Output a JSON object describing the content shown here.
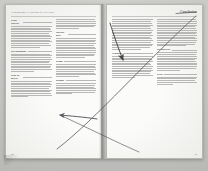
{
  "document": {
    "kind": "scanned-book-spread",
    "media": "photograph of an open book, two facing pages",
    "background_color": "#c9c9c7",
    "paper_color": "#fbfbf9",
    "ink_color": "#3a3a3a"
  },
  "left_page": {
    "running_head": "Terminologie et notions de référence",
    "folio": "84",
    "columns": [
      {
        "name": "left-column",
        "entries": [
          {
            "head": "Point central.",
            "body_lines": 14
          },
          {
            "head": "Rayonnement.",
            "body_lines": 12
          },
          {
            "head": "Plan de masse.",
            "body_lines": 11
          }
        ]
      },
      {
        "name": "right-column",
        "entries": [
          {
            "head": "",
            "body_lines": 6
          },
          {
            "head": "Surface utile.",
            "body_lines": 13
          },
          {
            "head": "Trame.",
            "body_lines": 10
          },
          {
            "head": "Module.",
            "body_lines": 9
          }
        ]
      }
    ]
  },
  "right_page": {
    "running_head": "Conclusion",
    "folio": "85",
    "columns": [
      {
        "name": "left-column",
        "entries": [
          {
            "head": "",
            "body_lines": 18
          },
          {
            "head": "Synthèse.",
            "body_lines": 14
          }
        ]
      },
      {
        "name": "right-column",
        "entries": [
          {
            "head": "",
            "body_lines": 16
          },
          {
            "head": "Perspectives.",
            "body_lines": 12
          },
          {
            "head": "Notes.",
            "body_lines": 6
          }
        ]
      }
    ]
  },
  "annotations": {
    "ink_color": "#4a4a52",
    "items": [
      {
        "name": "long-diagonal-arrow",
        "type": "arrow",
        "description": "long hand-drawn diagonal stroke rising from lower-left of the left page to the upper-right corner of the right page",
        "from": [
          58,
          148
        ],
        "to": [
          196,
          16
        ],
        "arrowhead": "none"
      },
      {
        "name": "down-left-arrow",
        "type": "arrow",
        "description": "short arrow from upper-left of the right page pointing down and to the left, with a filled arrowhead",
        "from": [
          111,
          24
        ],
        "to": [
          124,
          62
        ],
        "arrowhead": "filled"
      },
      {
        "name": "lower-diagonal-stroke",
        "type": "line",
        "description": "diagonal stroke descending from the mid right page toward the lower right, crossing the first diagonal",
        "from": [
          62,
          116
        ],
        "to": [
          140,
          152
        ],
        "arrowhead": "none"
      },
      {
        "name": "left-pointing-arrow",
        "type": "arrow",
        "description": "arrow on the left page pointing left at mid height",
        "from": [
          96,
          118
        ],
        "to": [
          58,
          115
        ],
        "arrowhead": "filled"
      },
      {
        "name": "corner-tick",
        "type": "mark",
        "description": "short horizontal ink tick near the top-right corner of the right page",
        "from": [
          176,
          13
        ],
        "to": [
          196,
          12
        ],
        "arrowhead": "none"
      }
    ]
  }
}
